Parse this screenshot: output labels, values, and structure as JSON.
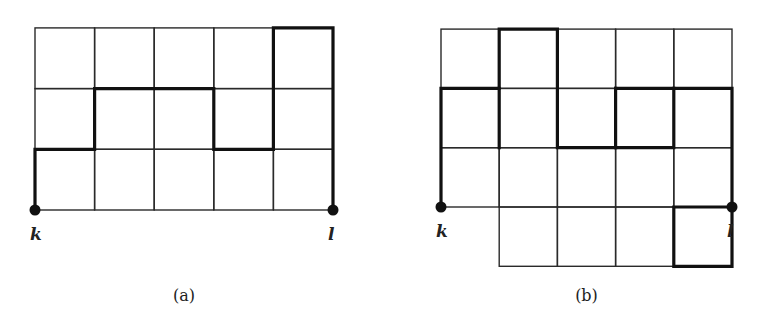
{
  "figures": [
    {
      "id": "a",
      "caption": "(a)",
      "origin": [
        35,
        210
      ],
      "cell": [
        59.6,
        60.7
      ],
      "cells": [
        [
          0,
          0
        ],
        [
          1,
          0
        ],
        [
          2,
          0
        ],
        [
          3,
          0
        ],
        [
          4,
          0
        ],
        [
          0,
          1
        ],
        [
          1,
          1
        ],
        [
          2,
          1
        ],
        [
          3,
          1
        ],
        [
          4,
          1
        ],
        [
          0,
          2
        ],
        [
          1,
          2
        ],
        [
          2,
          2
        ],
        [
          3,
          2
        ],
        [
          4,
          2
        ]
      ],
      "path": [
        [
          0,
          0
        ],
        [
          0,
          1
        ],
        [
          1,
          1
        ],
        [
          1,
          2
        ],
        [
          3,
          2
        ],
        [
          3,
          1
        ],
        [
          4,
          1
        ],
        [
          4,
          3
        ],
        [
          5,
          3
        ],
        [
          5,
          0
        ]
      ],
      "vertices": [
        {
          "label": "k",
          "pos": [
            0,
            0
          ]
        },
        {
          "label": "l",
          "pos": [
            5,
            0
          ]
        }
      ]
    },
    {
      "id": "b",
      "caption": "(b)",
      "origin": [
        441,
        207
      ],
      "cell": [
        58.2,
        59.3
      ],
      "cells": [
        [
          0,
          0
        ],
        [
          1,
          0
        ],
        [
          2,
          0
        ],
        [
          3,
          0
        ],
        [
          4,
          0
        ],
        [
          0,
          1
        ],
        [
          1,
          1
        ],
        [
          2,
          1
        ],
        [
          3,
          1
        ],
        [
          4,
          1
        ],
        [
          0,
          2
        ],
        [
          1,
          2
        ],
        [
          2,
          2
        ],
        [
          3,
          2
        ],
        [
          4,
          2
        ],
        [
          1,
          -1
        ],
        [
          2,
          -1
        ],
        [
          3,
          -1
        ],
        [
          4,
          -1
        ]
      ],
      "path": [
        [
          0,
          0
        ],
        [
          0,
          2
        ],
        [
          1,
          2
        ],
        [
          1,
          3
        ],
        [
          2,
          3
        ],
        [
          2,
          1
        ],
        [
          4,
          1
        ],
        [
          4,
          2
        ],
        [
          5,
          2
        ],
        [
          5,
          1
        ],
        [
          5,
          0
        ],
        [
          5,
          -1
        ],
        [
          4,
          -1
        ],
        [
          4,
          0
        ],
        [
          5,
          0
        ]
      ],
      "extra_bold": [
        [
          [
            3,
            2
          ],
          [
            4,
            2
          ]
        ],
        [
          [
            3,
            2
          ],
          [
            3,
            1
          ]
        ],
        [
          [
            1,
            2
          ],
          [
            1,
            1
          ]
        ]
      ],
      "vertices": [
        {
          "label": "k",
          "pos": [
            0,
            0
          ]
        },
        {
          "label": "l",
          "pos": [
            5,
            0
          ]
        }
      ]
    }
  ]
}
